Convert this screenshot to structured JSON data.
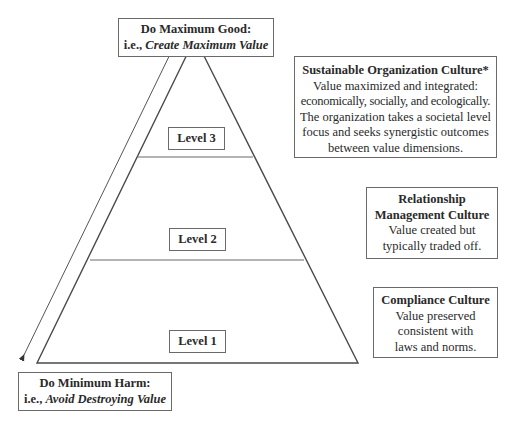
{
  "diagram": {
    "top_box": {
      "title": "Do Maximum Good:",
      "prefix": "i.e., ",
      "emphasis": "Create Maximum Value"
    },
    "bottom_box": {
      "title": "Do Minimum Harm:",
      "prefix": "i.e., ",
      "emphasis": "Avoid Destroying Value"
    },
    "levels": [
      {
        "label": "Level 3"
      },
      {
        "label": "Level 2"
      },
      {
        "label": "Level 1"
      }
    ],
    "cultures": [
      {
        "title": "Sustainable Organization Culture*",
        "lines": [
          "Value maximized and integrated:",
          "economically, socially, and ecologically.",
          "The organization takes a societal level",
          "focus and seeks synergistic outcomes",
          "between value dimensions."
        ]
      },
      {
        "title_lines": [
          "Relationship",
          "Management Culture"
        ],
        "lines": [
          "Value created but",
          "typically traded off."
        ]
      },
      {
        "title": "Compliance Culture",
        "lines": [
          "Value preserved",
          "consistent with",
          "laws and norms."
        ]
      }
    ],
    "colors": {
      "stroke": "#4a4a4a",
      "text": "#2a2a2a",
      "background": "#ffffff"
    }
  }
}
